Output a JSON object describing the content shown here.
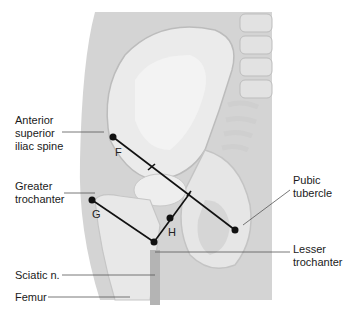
{
  "figure": {
    "type": "anatomical illustration"
  },
  "labels": {
    "asis": "Anterior\nsuperior\niliac spine",
    "greater_trochanter": "Greater\ntrochanter",
    "sciatic": "Sciatic n.",
    "femur": "Femur",
    "pubic_tubercle": "Pubic\ntubercle",
    "lesser_trochanter": "Lesser\ntrochanter"
  },
  "points": {
    "F": "F",
    "G": "G",
    "H": "H"
  },
  "colors": {
    "background_panel": "#d2d2d2",
    "bone": "#ebebeb",
    "bone_shadow": "#c8c8c8",
    "line": "#111111",
    "nerve": "#b0b0b0"
  }
}
